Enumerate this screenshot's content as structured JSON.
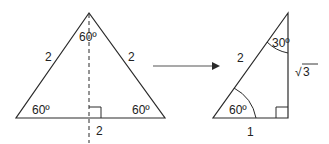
{
  "diagram": {
    "type": "geometry",
    "colors": {
      "line": "#2a2a2a",
      "text": "#222222",
      "background": "#ffffff"
    },
    "equilateral_triangle": {
      "side_left_label": "2",
      "side_right_label": "2",
      "base_label": "2",
      "apex_angle_label": "60º",
      "left_angle_label": "60º",
      "right_angle_label": "60º",
      "altitude": "dashed line from apex perpendicular to base",
      "right_angle_marker": true
    },
    "arrow": {
      "direction": "right"
    },
    "right_triangle": {
      "hypotenuse_label": "2",
      "base_label": "1",
      "height_label": "√3",
      "height_radical": "√",
      "height_radicand": "3",
      "top_angle_label": "30º",
      "bottom_left_angle_label": "60º",
      "right_angle_marker": true
    }
  }
}
